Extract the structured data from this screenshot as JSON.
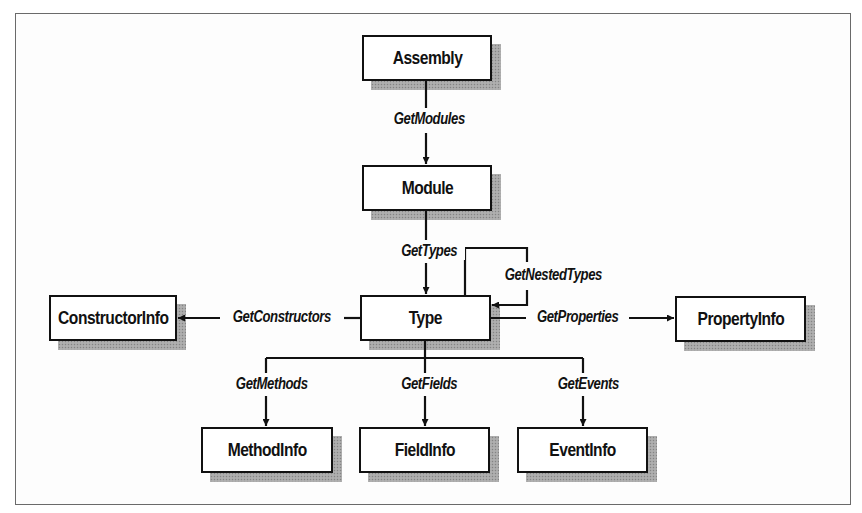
{
  "diagram": {
    "nodes": [
      {
        "id": "assembly",
        "label": "Assembly",
        "x": 362,
        "y": 35,
        "w": 130,
        "h": 46
      },
      {
        "id": "module",
        "label": "Module",
        "x": 362,
        "y": 165,
        "w": 130,
        "h": 46
      },
      {
        "id": "type",
        "label": "Type",
        "x": 360,
        "y": 295,
        "w": 131,
        "h": 46
      },
      {
        "id": "constructorinfo",
        "label": "ConstructorInfo",
        "x": 49,
        "y": 295,
        "w": 128,
        "h": 46
      },
      {
        "id": "propertyinfo",
        "label": "PropertyInfo",
        "x": 675,
        "y": 296,
        "w": 131,
        "h": 46
      },
      {
        "id": "methodinfo",
        "label": "MethodInfo",
        "x": 201,
        "y": 427,
        "w": 132,
        "h": 46
      },
      {
        "id": "fieldinfo",
        "label": "FieldInfo",
        "x": 359,
        "y": 427,
        "w": 131,
        "h": 46
      },
      {
        "id": "eventinfo",
        "label": "EventInfo",
        "x": 517,
        "y": 427,
        "w": 131,
        "h": 46
      }
    ],
    "edges": [
      {
        "from": "assembly",
        "to": "module",
        "label": "GetModules"
      },
      {
        "from": "module",
        "to": "type",
        "label": "GetTypes"
      },
      {
        "from": "type",
        "to": "type",
        "label": "GetNestedTypes"
      },
      {
        "from": "type",
        "to": "constructorinfo",
        "label": "GetConstructors"
      },
      {
        "from": "type",
        "to": "propertyinfo",
        "label": "GetProperties"
      },
      {
        "from": "type",
        "to": "methodinfo",
        "label": "GetMethods"
      },
      {
        "from": "type",
        "to": "fieldinfo",
        "label": "GetFields"
      },
      {
        "from": "type",
        "to": "eventinfo",
        "label": "GetEvents"
      }
    ]
  },
  "labels": {
    "assembly": "Assembly",
    "module": "Module",
    "type": "Type",
    "constructorinfo": "ConstructorInfo",
    "propertyinfo": "PropertyInfo",
    "methodinfo": "MethodInfo",
    "fieldinfo": "FieldInfo",
    "eventinfo": "EventInfo",
    "get_modules": "GetModules",
    "get_types": "GetTypes",
    "get_nested_types": "GetNestedTypes",
    "get_constructors": "GetConstructors",
    "get_properties": "GetProperties",
    "get_methods": "GetMethods",
    "get_fields": "GetFields",
    "get_events": "GetEvents"
  },
  "colors": {
    "stroke": "#111111",
    "background": "#ffffff",
    "frame": "#6a6a6a",
    "shadow": "#9a9a9a"
  }
}
